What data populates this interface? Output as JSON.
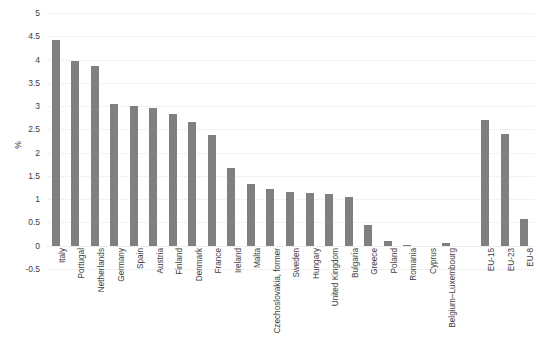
{
  "chart_data": {
    "type": "bar",
    "title": "",
    "subtitle": "",
    "xlabel": "",
    "ylabel": "%",
    "ylim": [
      -0.5,
      5
    ],
    "ytick_step": 0.5,
    "yticks": [
      5,
      4.5,
      4,
      3.5,
      3,
      2.5,
      2,
      1.5,
      1,
      0.5,
      0,
      -0.5
    ],
    "ytick_labels": [
      "5",
      "4.5",
      "4",
      "3.5",
      "3",
      "2.5",
      "2",
      "1.5",
      "1",
      "0.5",
      "0",
      "-0.5"
    ],
    "grid": true,
    "legend": "none",
    "bar_color": "#808080",
    "background_color": "#ffffff",
    "gridline_color": "#f2f2f2",
    "orientation": "vertical",
    "xtick_rotation": 90,
    "categories": [
      "Italy",
      "Portugal",
      "Netherlands",
      "Germany",
      "Spain",
      "Austria",
      "Finland",
      "Denmark",
      "France",
      "Ireland",
      "Malta",
      "Czechoslovakia, former",
      "Sweden",
      "Hungary",
      "United Kingdom",
      "Bulgaria",
      "Greece",
      "Poland",
      "Romania",
      "Cyprus",
      "Belgium–Luxembourg",
      "",
      "EU-15",
      "EU-23",
      "EU-8"
    ],
    "values": [
      4.43,
      3.96,
      3.86,
      3.04,
      3.0,
      2.97,
      2.83,
      2.66,
      2.38,
      1.68,
      1.33,
      1.21,
      1.15,
      1.13,
      1.12,
      1.04,
      0.44,
      0.1,
      0.02,
      0.0,
      0.05,
      null,
      2.7,
      2.4,
      0.58
    ],
    "series_name": "share"
  }
}
